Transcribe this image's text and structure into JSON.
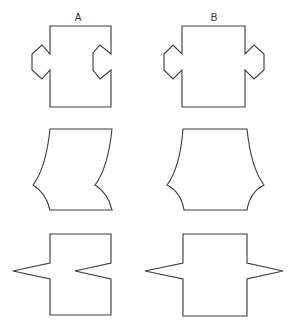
{
  "columns": [
    {
      "label": "A",
      "x": 78
    },
    {
      "label": "B",
      "x": 214
    }
  ],
  "colors": {
    "stroke": "#3a3a3a",
    "background": "#ffffff"
  },
  "rows": [
    {
      "name": "hexagonal-tab-shapes",
      "A": "square with hexagonal tab protruding on left and matching hexagonal notch cut into right side",
      "B": "square with hexagonal tabs protruding on both left and right sides"
    },
    {
      "name": "curved-side-shapes",
      "A": "quadrilateral with both sides bowed leftward (sheared curve) forming pointed corners at lower left and lower right",
      "B": "quadrilateral with both sides bowed outward symmetrically forming pointed corners at lower left and lower right"
    },
    {
      "name": "triangular-spike-shapes",
      "A": "square with triangular spike protruding left and matching triangular notch cut into right side",
      "B": "square with triangular spikes protruding on both left and right sides"
    }
  ]
}
